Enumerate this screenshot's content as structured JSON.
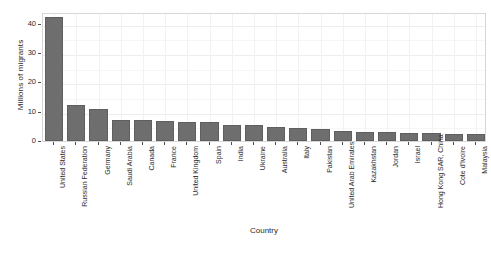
{
  "chart_data": {
    "type": "bar",
    "title": "",
    "xlabel": "Country",
    "ylabel": "Millions of migrants",
    "ylim": [
      0,
      44
    ],
    "yticks": [
      0,
      10,
      20,
      30,
      40
    ],
    "ytick_labels": [
      "0",
      "10",
      "20",
      "30",
      "40"
    ],
    "grid": true,
    "legend": "none",
    "bar_color": "#6e6e6e",
    "panel_border_color": "#d6d6d6",
    "gridline_color": "#ededed",
    "categories": [
      "United States",
      "Russian Federation",
      "Germany",
      "Saudi Arabia",
      "Canada",
      "France",
      "United Kingdom",
      "Spain",
      "India",
      "Ukraine",
      "Australia",
      "Italy",
      "Pakistan",
      "United Arab Emirates",
      "Kazakhstan",
      "Jordan",
      "Israel",
      "Hong Kong SAR, China",
      "Cote d'Ivoire",
      "Malaysia"
    ],
    "values": [
      42.4,
      12.3,
      10.8,
      7.3,
      7.2,
      6.7,
      6.5,
      6.4,
      5.4,
      5.3,
      4.7,
      4.5,
      4.2,
      3.3,
      3.1,
      3.0,
      2.9,
      2.8,
      2.4,
      2.4
    ]
  }
}
